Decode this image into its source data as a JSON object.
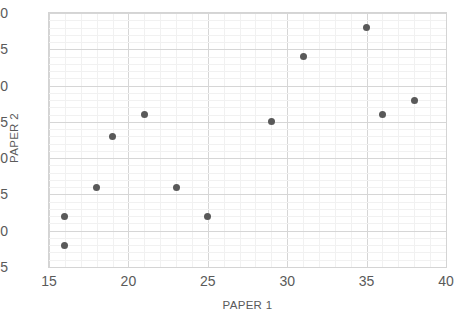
{
  "chart_data": {
    "type": "scatter",
    "title": "",
    "xlabel": "PAPER 1",
    "ylabel": "PAPER 2",
    "xlim": [
      15,
      40
    ],
    "ylim": [
      5,
      40
    ],
    "x_ticks": [
      15,
      20,
      25,
      30,
      35,
      40
    ],
    "y_ticks": [
      5,
      10,
      15,
      20,
      25,
      30,
      35,
      40
    ],
    "x_minor_step": 1,
    "y_minor_step": 1,
    "grid": true,
    "legend": false,
    "marker_color": "#595959",
    "major_grid_color": "#d6d6d6",
    "minor_grid_color": "#f1f1f1",
    "plot_border_color": "#d4d4d4",
    "series": [
      {
        "name": "PAPER 1 vs PAPER 2",
        "points": [
          {
            "x": 16,
            "y": 12
          },
          {
            "x": 16,
            "y": 8
          },
          {
            "x": 18,
            "y": 16
          },
          {
            "x": 19,
            "y": 23
          },
          {
            "x": 21,
            "y": 26
          },
          {
            "x": 23,
            "y": 16
          },
          {
            "x": 25,
            "y": 12
          },
          {
            "x": 29,
            "y": 25
          },
          {
            "x": 31,
            "y": 34
          },
          {
            "x": 35,
            "y": 38
          },
          {
            "x": 36,
            "y": 26
          },
          {
            "x": 38,
            "y": 28
          }
        ]
      }
    ]
  },
  "axes": {
    "x_title": "PAPER 1",
    "y_title": "PAPER 2",
    "x_tick_labels": [
      "15",
      "20",
      "25",
      "30",
      "35",
      "40"
    ],
    "y_tick_labels": [
      "40",
      "35",
      "30",
      "25",
      "20",
      "15",
      "10",
      "5"
    ]
  },
  "header": {
    "title": ""
  }
}
